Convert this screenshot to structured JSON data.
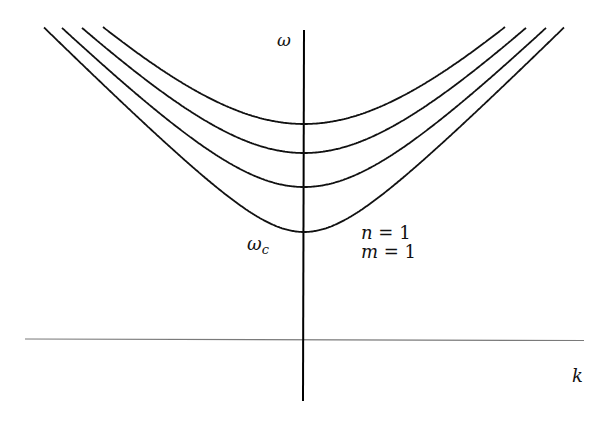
{
  "diagram": {
    "type": "dispersion-relation",
    "axes": {
      "vertical_label": "ω",
      "horizontal_label": "k",
      "origin_px": {
        "x": 304,
        "y": 339
      },
      "vertical": {
        "x": 304,
        "y_top": 30,
        "y_bottom": 401,
        "color": "#000000",
        "width": 2
      },
      "horizontal": {
        "y": 339,
        "x_left": 25,
        "x_right": 584,
        "color": "#7a7a7a",
        "width": 1.2
      }
    },
    "labels": {
      "omega": {
        "base": "ω",
        "x": 277,
        "y": 46
      },
      "k": {
        "base": "k",
        "x": 572,
        "y": 382
      },
      "omega_c": {
        "base": "ω",
        "sub": "c",
        "x": 247,
        "y": 250
      },
      "mode_n": {
        "lhs": "n",
        "eq": " = ",
        "rhs": "1",
        "x": 361,
        "y": 239
      },
      "mode_m": {
        "lhs": "m",
        "eq": " = ",
        "rhs": "1",
        "x": 361,
        "y": 258
      }
    },
    "curves": [
      {
        "name": "lowest-mode",
        "min_y": 232,
        "a": 63,
        "slope": 1.0,
        "color": "#111111"
      },
      {
        "name": "mode-2",
        "min_y": 187,
        "a": 104.5,
        "slope": 1.0,
        "color": "#111111"
      },
      {
        "name": "mode-3",
        "min_y": 153,
        "a": 134.3,
        "slope": 1.0,
        "color": "#111111"
      },
      {
        "name": "mode-4",
        "min_y": 124,
        "a": 159.8,
        "slope": 1.0,
        "color": "#111111"
      }
    ],
    "curve_clip_y_top": 27,
    "curve_x_range": [
      30,
      580
    ]
  }
}
